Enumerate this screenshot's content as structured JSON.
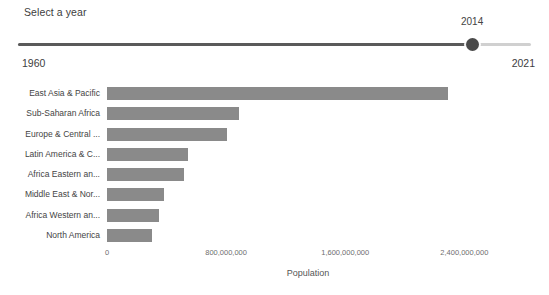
{
  "slider": {
    "title": "Select a year",
    "value": "2014",
    "min_label": "1960",
    "max_label": "2021",
    "min": 1960,
    "max": 2021,
    "current": 2014,
    "fill_color": "#5a5a5a",
    "track_color": "#d0d0d0",
    "handle_color": "#4a4a4a"
  },
  "chart_data": {
    "type": "bar",
    "orientation": "horizontal",
    "title": "",
    "xlabel": "Population",
    "ylabel": "",
    "bar_color": "#8a8a8a",
    "grid": false,
    "legend": "none",
    "xlim": [
      0,
      2700000000
    ],
    "xticks": [
      0,
      800000000,
      1600000000,
      2400000000
    ],
    "xtick_labels": [
      "0",
      "800,000,000",
      "1,600,000,000",
      "2,400,000,000"
    ],
    "categories": [
      "East Asia & Pacific",
      "Sub-Saharan Africa",
      "Europe & Central ...",
      "Latin America & C...",
      "Africa Eastern an...",
      "Middle East & Nor...",
      "Africa Western an...",
      "North America"
    ],
    "values": [
      2290000000,
      885000000,
      803000000,
      547000000,
      517000000,
      380000000,
      348000000,
      305000000
    ]
  }
}
